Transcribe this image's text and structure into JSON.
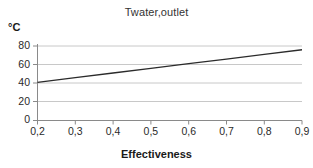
{
  "chart_data": {
    "type": "line",
    "title": "Twater,outlet",
    "xlabel": "Effectiveness",
    "ylabel": "°C",
    "x": [
      0.2,
      0.3,
      0.4,
      0.5,
      0.6,
      0.7,
      0.8,
      0.9
    ],
    "xtick_labels": [
      "0,2",
      "0,3",
      "0,4",
      "0,5",
      "0,6",
      "0,7",
      "0,8",
      "0,9"
    ],
    "values": [
      41,
      46,
      51,
      56,
      61,
      66,
      71,
      76
    ],
    "ytick_labels": [
      "80",
      "60",
      "40",
      "20",
      "0"
    ],
    "yticks": [
      80,
      60,
      40,
      20,
      0
    ],
    "xlim": [
      0.2,
      0.9
    ],
    "ylim": [
      0,
      80
    ],
    "grid": "horizontal",
    "legend": "none",
    "series": [
      {
        "name": "Twater,outlet",
        "values": [
          41,
          46,
          51,
          56,
          61,
          66,
          71,
          76
        ],
        "color": "#2b2b2b"
      }
    ],
    "colors": {
      "line": "#2b2b2b",
      "grid": "#c8c8c8",
      "axis": "#8a8a8a",
      "background": "#ffffff",
      "text": "#1a1a1a"
    }
  }
}
